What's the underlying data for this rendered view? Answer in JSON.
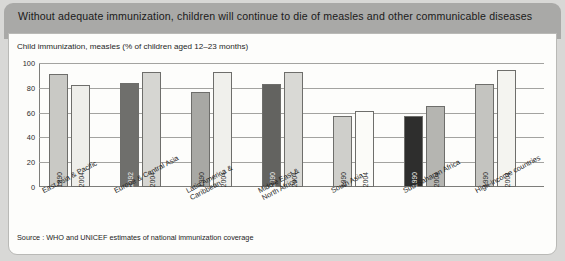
{
  "header": {
    "title": "Without adequate immunization, children will continue to die of measles and other communicable diseases"
  },
  "subtitle": "Child immunization, measles (% of children aged 12–23 months)",
  "source": "Source : WHO and UNICEF estimates of national immunization coverage",
  "chart_data": {
    "type": "bar",
    "title": "Child immunization, measles (% of children aged 12–23 months)",
    "xlabel": "",
    "ylabel": "",
    "ylim": [
      0,
      100
    ],
    "yticks": [
      "0",
      "20",
      "40",
      "60",
      "80",
      "100"
    ],
    "grid": true,
    "legend": "none",
    "categories": [
      "East Asia & Pacific",
      "Europe & Central Asia",
      "Latin America &\nCaribbean",
      "Middle East &\nNorth Africa",
      "South Asia",
      "Sub-Saharan Africa",
      "High-income countries"
    ],
    "bars": [
      {
        "category": "East Asia & Pacific",
        "year": "1990",
        "value": 91,
        "color": "#c9c9c5"
      },
      {
        "category": "East Asia & Pacific",
        "year": "2004",
        "value": 82,
        "color": "#eeeeea"
      },
      {
        "category": "Europe & Central Asia",
        "year": "1992",
        "value": 84,
        "color": "#6f6f6c"
      },
      {
        "category": "Europe & Central Asia",
        "year": "2004",
        "value": 93,
        "color": "#d6d6d2"
      },
      {
        "category": "Latin America & Caribbean",
        "year": "1990",
        "value": 77,
        "color": "#a8a8a4"
      },
      {
        "category": "Latin America & Caribbean",
        "year": "2004",
        "value": 93,
        "color": "#f0f0ec"
      },
      {
        "category": "Middle East & North Africa",
        "year": "1990",
        "value": 83,
        "color": "#636360"
      },
      {
        "category": "Middle East & North Africa",
        "year": "2004",
        "value": 93,
        "color": "#d9d9d5"
      },
      {
        "category": "South Asia",
        "year": "1990",
        "value": 57,
        "color": "#cfcfcb"
      },
      {
        "category": "South Asia",
        "year": "2004",
        "value": 61,
        "color": "#fbfbf8"
      },
      {
        "category": "Sub-Saharan Africa",
        "year": "1990",
        "value": 57,
        "color": "#2e2e2d"
      },
      {
        "category": "Sub-Saharan Africa",
        "year": "2004",
        "value": 65,
        "color": "#b5b5b1"
      },
      {
        "category": "High-income countries",
        "year": "1990",
        "value": 83,
        "color": "#c4c4c0"
      },
      {
        "category": "High-income countries",
        "year": "2004",
        "value": 94,
        "color": "#f4f4f0"
      }
    ]
  }
}
